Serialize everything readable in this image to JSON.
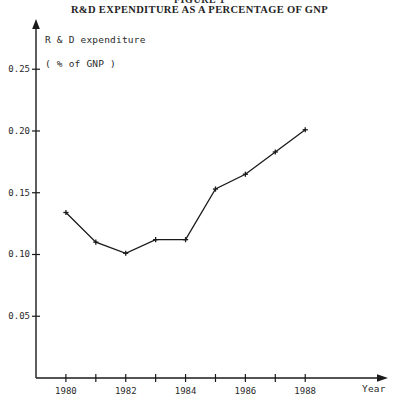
{
  "figure": {
    "figure_number": "FIGURE 1",
    "title": "R&D EXPENDITURE AS A PERCENTAGE OF GNP",
    "y_caption_line1": "R & D expenditure",
    "y_caption_line2": "( % of GNP )",
    "x_caption": "Year"
  },
  "chart_data": {
    "type": "line",
    "title": "R&D EXPENDITURE AS A PERCENTAGE OF GNP",
    "subtitle": "FIGURE 1",
    "xlabel": "Year",
    "ylabel": "R & D expenditure ( % of GNP )",
    "x": [
      1980,
      1981,
      1982,
      1983,
      1984,
      1985,
      1986,
      1987,
      1988
    ],
    "values": [
      0.134,
      0.11,
      0.101,
      0.112,
      0.112,
      0.153,
      0.165,
      0.183,
      0.201
    ],
    "series": [
      {
        "name": "R & D expenditure (% of GNP)",
        "values": [
          0.134,
          0.11,
          0.101,
          0.112,
          0.112,
          0.153,
          0.165,
          0.183,
          0.201
        ]
      }
    ],
    "xlim": [
      1979.0,
      1990.5
    ],
    "ylim": [
      0.0,
      0.285
    ],
    "xticks": [
      1980,
      1981,
      1982,
      1983,
      1984,
      1985,
      1986,
      1987,
      1988
    ],
    "xtick_labels": [
      "1980",
      "",
      "1982",
      "",
      "1984",
      "",
      "1986",
      "",
      "1988"
    ],
    "yticks": [
      0.05,
      0.1,
      0.15,
      0.2,
      0.25
    ],
    "ytick_labels": [
      "0.05",
      "0.10",
      "0.15",
      "0.20",
      "0.25"
    ],
    "grid": false,
    "legend": "none",
    "marker": "cross",
    "line_color": "#1a1a1a",
    "axis_color": "#1a1a1a"
  },
  "ytick_labels": [
    "0.25",
    "0.20",
    "0.15",
    "0.10",
    "0.05"
  ],
  "xtick_labels": [
    "1980",
    "1982",
    "1984",
    "1986",
    "1988"
  ]
}
